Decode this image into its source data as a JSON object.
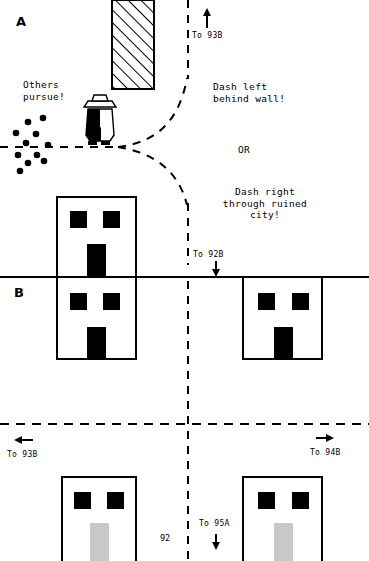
{
  "page": {
    "number": "92",
    "width": 369,
    "height": 561,
    "background": "#ffffff",
    "ink": "#000000",
    "door_gray": "#c8c8c8"
  },
  "panels": {
    "a_label": "A",
    "b_label": "B"
  },
  "narration": {
    "others_pursue": "Others\npursue!",
    "dash_left": "Dash left\nbehind wall!",
    "or": "OR",
    "dash_right": "Dash right\nthrough ruined\ncity!"
  },
  "nav_links": [
    {
      "name": "to-93b-top",
      "label": "To 93B",
      "arrow": "up"
    },
    {
      "name": "to-92b",
      "label": "To 92B",
      "arrow": "down"
    },
    {
      "name": "to-93b-bottom",
      "label": "To 93B",
      "arrow": "left"
    },
    {
      "name": "to-94b",
      "label": "To 94B",
      "arrow": "right"
    },
    {
      "name": "to-95a",
      "label": "To 95A",
      "arrow": "down"
    }
  ],
  "map_features": {
    "hatched_wall": "hatched-wall",
    "figure": "hero-figure-with-hat",
    "pursuer_dots_count": 11,
    "buildings": [
      {
        "name": "building-center-upper",
        "door": "black"
      },
      {
        "name": "building-center-lower",
        "door": "black"
      },
      {
        "name": "building-right-mid",
        "door": "black"
      },
      {
        "name": "building-bottom-left",
        "door": "gray"
      },
      {
        "name": "building-bottom-right",
        "door": "gray"
      }
    ],
    "paths": [
      "horizontal-dashed-road",
      "curved-dashed-fork-up",
      "curved-dashed-fork-down",
      "vertical-dashed-road",
      "horizontal-solid-road",
      "lower-horizontal-dashed-road"
    ]
  }
}
